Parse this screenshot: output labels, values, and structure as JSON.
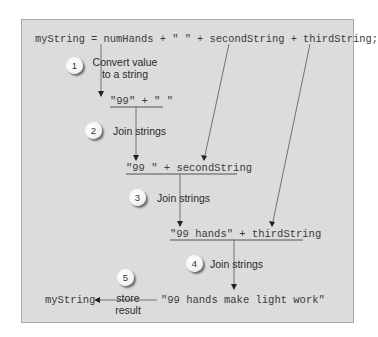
{
  "diagram": {
    "statement": "myString = numHands + \" \" + secondString + thirdString;",
    "steps": [
      {
        "number": "1",
        "label": "Convert value\nto a string",
        "expression": "\"99\" + \" \""
      },
      {
        "number": "2",
        "label": "Join strings",
        "expression": "\"99 \" + secondString"
      },
      {
        "number": "3",
        "label": "Join strings",
        "expression": "\"99 hands\" + thirdString"
      },
      {
        "number": "4",
        "label": "Join strings",
        "expression": "\"99 hands make light work\""
      },
      {
        "number": "5",
        "label": "store\nresult",
        "target": "myString"
      }
    ]
  },
  "colors": {
    "panel_background": "#dcdcdc",
    "panel_border": "#a8a8a8",
    "line": "#555555",
    "text": "#3a3a3a"
  }
}
